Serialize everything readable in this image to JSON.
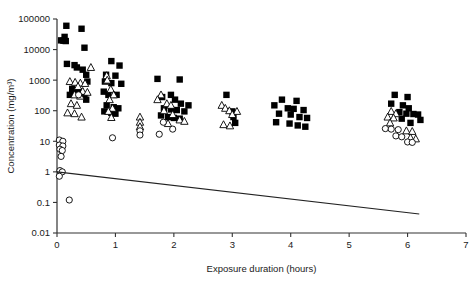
{
  "chart_data": {
    "type": "scatter",
    "title": "",
    "xlabel": "Exposure duration (hours)",
    "ylabel": "Concentration (mg/m³)",
    "xlim": [
      0,
      7
    ],
    "ylim": [
      0.01,
      100000
    ],
    "yscale": "log",
    "xticks": [
      "0",
      "1",
      "2",
      "3",
      "4",
      "5",
      "6",
      "7"
    ],
    "xtick_values": [
      0,
      1,
      2,
      3,
      4,
      5,
      6,
      7
    ],
    "yticks": [
      "0.01",
      "0.1",
      "1",
      "10",
      "100",
      "1000",
      "10000",
      "100000"
    ],
    "ytick_values": [
      0.01,
      0.1,
      1,
      10,
      100,
      1000,
      10000,
      100000
    ],
    "grid": false,
    "legend": null,
    "annotations": [],
    "series": [
      {
        "name": "filled-square",
        "marker": "square",
        "fill": "#000000",
        "points": [
          [
            0.16,
            60000
          ],
          [
            0.13,
            26000
          ],
          [
            0.07,
            20000
          ],
          [
            0.11,
            19500
          ],
          [
            0.15,
            19000
          ],
          [
            0.42,
            48000
          ],
          [
            0.47,
            11500
          ],
          [
            0.17,
            3400
          ],
          [
            0.3,
            3100
          ],
          [
            0.34,
            2600
          ],
          [
            0.44,
            2200
          ],
          [
            0.5,
            1500
          ],
          [
            0.52,
            900
          ],
          [
            0.26,
            520
          ],
          [
            0.33,
            470
          ],
          [
            0.4,
            430
          ],
          [
            0.22,
            330
          ],
          [
            0.47,
            330
          ],
          [
            0.5,
            230
          ],
          [
            0.93,
            4200
          ],
          [
            1.07,
            3000
          ],
          [
            0.84,
            1500
          ],
          [
            1.0,
            1400
          ],
          [
            0.82,
            900
          ],
          [
            0.93,
            800
          ],
          [
            1.1,
            760
          ],
          [
            0.8,
            420
          ],
          [
            0.88,
            330
          ],
          [
            1.02,
            330
          ],
          [
            0.85,
            150
          ],
          [
            0.97,
            130
          ],
          [
            1.05,
            120
          ],
          [
            0.81,
            95
          ],
          [
            0.93,
            85
          ],
          [
            1.0,
            80
          ],
          [
            1.72,
            1100
          ],
          [
            2.1,
            1050
          ],
          [
            1.95,
            330
          ],
          [
            1.8,
            280
          ],
          [
            2.02,
            230
          ],
          [
            2.12,
            170
          ],
          [
            2.25,
            150
          ],
          [
            1.83,
            120
          ],
          [
            1.95,
            110
          ],
          [
            2.05,
            105
          ],
          [
            2.18,
            95
          ],
          [
            1.78,
            70
          ],
          [
            1.9,
            62
          ],
          [
            2.0,
            58
          ],
          [
            2.1,
            55
          ],
          [
            2.9,
            330
          ],
          [
            3.0,
            95
          ],
          [
            3.02,
            62
          ],
          [
            3.05,
            40
          ],
          [
            3.85,
            230
          ],
          [
            4.1,
            210
          ],
          [
            3.72,
            150
          ],
          [
            3.95,
            120
          ],
          [
            4.05,
            115
          ],
          [
            4.22,
            105
          ],
          [
            3.8,
            80
          ],
          [
            4.0,
            75
          ],
          [
            4.15,
            62
          ],
          [
            4.28,
            58
          ],
          [
            3.75,
            42
          ],
          [
            3.98,
            38
          ],
          [
            4.12,
            33
          ],
          [
            4.25,
            30
          ],
          [
            5.78,
            330
          ],
          [
            6.0,
            280
          ],
          [
            5.72,
            170
          ],
          [
            5.92,
            150
          ],
          [
            6.02,
            120
          ],
          [
            5.86,
            90
          ],
          [
            5.98,
            80
          ],
          [
            6.1,
            78
          ],
          [
            6.18,
            75
          ],
          [
            5.9,
            55
          ],
          [
            6.22,
            50
          ],
          [
            6.05,
            40
          ]
        ]
      },
      {
        "name": "open-triangle",
        "marker": "triangle",
        "fill": "#ffffff",
        "points": [
          [
            0.58,
            2600
          ],
          [
            0.22,
            900
          ],
          [
            0.31,
            850
          ],
          [
            0.4,
            800
          ],
          [
            0.48,
            780
          ],
          [
            0.36,
            620
          ],
          [
            0.44,
            430
          ],
          [
            0.52,
            400
          ],
          [
            0.3,
            330
          ],
          [
            0.4,
            300
          ],
          [
            0.24,
            170
          ],
          [
            0.34,
            150
          ],
          [
            0.18,
            85
          ],
          [
            0.3,
            80
          ],
          [
            0.42,
            62
          ],
          [
            0.85,
            1400
          ],
          [
            0.86,
            1000
          ],
          [
            0.92,
            500
          ],
          [
            0.97,
            330
          ],
          [
            0.9,
            230
          ],
          [
            0.95,
            120
          ],
          [
            0.88,
            95
          ],
          [
            0.93,
            60
          ],
          [
            1.42,
            62
          ],
          [
            1.42,
            42
          ],
          [
            1.42,
            30
          ],
          [
            1.78,
            330
          ],
          [
            1.72,
            230
          ],
          [
            1.88,
            170
          ],
          [
            1.95,
            150
          ],
          [
            1.83,
            100
          ],
          [
            1.98,
            75
          ],
          [
            2.1,
            50
          ],
          [
            2.18,
            45
          ],
          [
            1.9,
            38
          ],
          [
            2.82,
            150
          ],
          [
            2.88,
            120
          ],
          [
            2.95,
            100
          ],
          [
            3.08,
            95
          ],
          [
            3.0,
            75
          ],
          [
            2.85,
            35
          ],
          [
            2.96,
            32
          ],
          [
            5.72,
            95
          ],
          [
            5.8,
            80
          ],
          [
            5.66,
            62
          ],
          [
            5.76,
            58
          ],
          [
            5.7,
            40
          ],
          [
            5.98,
            22
          ],
          [
            6.08,
            21
          ],
          [
            6.05,
            13
          ],
          [
            6.14,
            12
          ]
        ]
      },
      {
        "name": "open-circle",
        "marker": "circle",
        "fill": "#ffffff",
        "points": [
          [
            0.04,
            11
          ],
          [
            0.1,
            10
          ],
          [
            0.04,
            7.5
          ],
          [
            0.1,
            7.0
          ],
          [
            0.05,
            5.5
          ],
          [
            0.09,
            5.0
          ],
          [
            0.07,
            3.2
          ],
          [
            0.05,
            1.1
          ],
          [
            0.09,
            1.0
          ],
          [
            0.04,
            0.72
          ],
          [
            0.21,
            0.12
          ],
          [
            0.37,
            330
          ],
          [
            0.95,
            13
          ],
          [
            1.42,
            22
          ],
          [
            1.42,
            16
          ],
          [
            1.82,
            42
          ],
          [
            1.98,
            25
          ],
          [
            1.75,
            17
          ],
          [
            5.62,
            26
          ],
          [
            5.72,
            25
          ],
          [
            5.84,
            24
          ],
          [
            5.8,
            15
          ],
          [
            5.9,
            14
          ],
          [
            6.0,
            9.5
          ],
          [
            6.08,
            9.2
          ]
        ]
      }
    ],
    "trendline": {
      "name": "regression-line",
      "x_start": 0.0,
      "y_start": 1.0,
      "x_end": 6.2,
      "y_end": 0.042
    }
  }
}
